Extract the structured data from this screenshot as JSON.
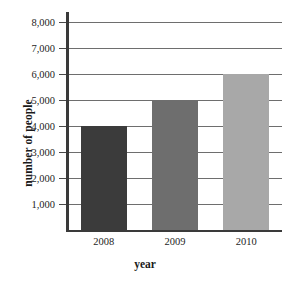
{
  "chart_data": {
    "type": "bar",
    "title": "",
    "categories": [
      "2008",
      "2009",
      "2010"
    ],
    "values": [
      4000,
      5000,
      6000
    ],
    "series": [
      {
        "name": "number of people",
        "values": [
          4000,
          5000,
          6000
        ]
      }
    ],
    "xlabel": "year",
    "ylabel": "number of people",
    "ylim": [
      0,
      8000
    ],
    "ytick_labels": [
      "1,000",
      "2,000",
      "3,000",
      "4,000",
      "5,000",
      "6,000",
      "7,000",
      "8,000"
    ],
    "ytick_values": [
      1000,
      2000,
      3000,
      4000,
      5000,
      6000,
      7000,
      8000
    ],
    "grid": true,
    "legend": "none",
    "bar_colors": [
      "#3b3b3b",
      "#6e6e6e",
      "#a8a8a8"
    ],
    "axis_color": "#3a3a3a",
    "gridline_color": "#6e6e6e",
    "background_color": "#ffffff"
  }
}
